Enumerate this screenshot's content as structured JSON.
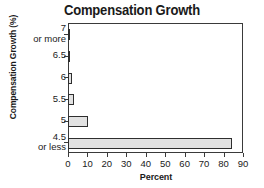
{
  "chart_data": {
    "type": "bar",
    "orientation": "horizontal",
    "title": "Compensation Growth",
    "xlabel": "Percent",
    "ylabel": "Compensation Growth (%)",
    "categories": [
      "7 or more",
      "6.5",
      "6",
      "5.5",
      "5",
      "4.5 or less"
    ],
    "category_lines": [
      [
        "7",
        "or more"
      ],
      [
        "6.5",
        ""
      ],
      [
        "6",
        ""
      ],
      [
        "5.5",
        ""
      ],
      [
        "5",
        ""
      ],
      [
        "4.5",
        "or less"
      ]
    ],
    "values": [
      0.8,
      0.5,
      2,
      3,
      10,
      84
    ],
    "xlim": [
      0,
      90
    ],
    "xticks": [
      0,
      10,
      20,
      30,
      40,
      50,
      60,
      70,
      80,
      90
    ],
    "grid": false,
    "legend": false,
    "bar_fill_color": "#e2e2e2",
    "bar_edge_color": "#2e2e2e",
    "axis_color": "#3a3a3a",
    "background_color": "#ffffff"
  }
}
